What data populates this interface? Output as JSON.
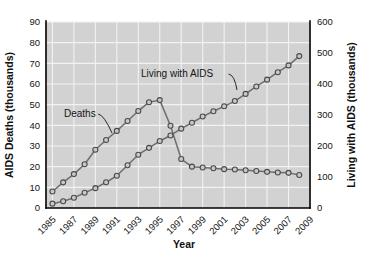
{
  "chart_data": {
    "type": "line",
    "title": "",
    "xlabel": "Year",
    "ylabel": "AIDS Deaths (thousands)",
    "y2label": "Living with AIDS (thousands)",
    "grid": true,
    "legend_position": "inline-annotations",
    "x": [
      1985,
      1986,
      1987,
      1988,
      1989,
      1990,
      1991,
      1992,
      1993,
      1994,
      1995,
      1996,
      1997,
      1998,
      1999,
      2000,
      2001,
      2002,
      2003,
      2004,
      2005,
      2006,
      2007,
      2008
    ],
    "xtick_labels": [
      "1985",
      "1987",
      "1989",
      "1991",
      "1993",
      "1995",
      "1997",
      "1999",
      "2001",
      "2003",
      "2005",
      "2007",
      "2009"
    ],
    "xtick_values": [
      1985,
      1987,
      1989,
      1991,
      1993,
      1995,
      1997,
      1999,
      2001,
      2003,
      2005,
      2007,
      2009
    ],
    "xlim": [
      1984.4,
      2009.0
    ],
    "ytick_labels": [
      "0",
      "10",
      "20",
      "30",
      "40",
      "50",
      "60",
      "70",
      "80",
      "90"
    ],
    "ytick_values": [
      0,
      10,
      20,
      30,
      40,
      50,
      60,
      70,
      80,
      90
    ],
    "ylim": [
      0,
      90
    ],
    "y2tick_labels": [
      "0",
      "100",
      "200",
      "300",
      "400",
      "500",
      "600"
    ],
    "y2tick_values": [
      0,
      100,
      200,
      300,
      400,
      500,
      600
    ],
    "y2lim": [
      0,
      600
    ],
    "series": [
      {
        "name": "Deaths",
        "axis": "left",
        "annotation": "Deaths",
        "values": [
          8.0,
          12.4,
          16.4,
          21.2,
          28.2,
          32.9,
          37.3,
          42.1,
          46.9,
          51.2,
          52.2,
          39.8,
          23.7,
          20.0,
          19.6,
          19.2,
          18.8,
          18.6,
          18.3,
          17.9,
          17.5,
          17.2,
          17.0,
          16.0
        ]
      },
      {
        "name": "Living with AIDS",
        "axis": "right",
        "annotation": "Living with AIDS",
        "values": [
          14,
          22,
          33,
          49,
          64,
          83,
          104,
          138,
          172,
          194,
          216,
          234,
          256,
          275,
          295,
          312,
          328,
          345,
          368,
          392,
          414,
          438,
          460,
          490
        ]
      }
    ],
    "colors": {
      "plot_background": "#d2d2d2",
      "gridline": "#f2f2f2",
      "line": "#6e6e6e",
      "marker_fill": "#c9c9c9",
      "marker_stroke": "#4a4a4a",
      "axis": "#000000",
      "text": "#141414"
    },
    "annotations": [
      {
        "text": "Deaths",
        "label_x": 64,
        "label_y": 117,
        "leader_to_x": 112,
        "leader_to_y": 133
      },
      {
        "text": "Living with AIDS",
        "label_x": 141,
        "label_y": 77,
        "leader_to_x": 237,
        "leader_to_y": 90
      }
    ]
  }
}
